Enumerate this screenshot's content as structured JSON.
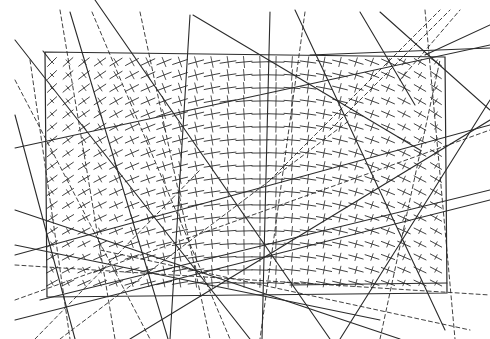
{
  "artwork": {
    "width": 490,
    "height": 339,
    "background": "#ffffff",
    "ink": "#2b2b2b",
    "frame": [
      [
        45,
        52
      ],
      [
        445,
        57
      ],
      [
        447,
        293
      ],
      [
        47,
        297
      ]
    ],
    "hatch_grid": {
      "x0": 52,
      "x1": 440,
      "y0": 62,
      "y1": 288,
      "step_x": 16,
      "step_y": 13,
      "mark_length": 14
    },
    "solid_lines": [
      [
        [
          43,
          51
        ],
        [
          50,
          60
        ]
      ],
      [
        [
          70,
          12
        ],
        [
          168,
          339
        ]
      ],
      [
        [
          15,
          115
        ],
        [
          75,
          339
        ]
      ],
      [
        [
          190,
          15
        ],
        [
          170,
          339
        ]
      ],
      [
        [
          270,
          12
        ],
        [
          262,
          339
        ]
      ],
      [
        [
          193,
          15
        ],
        [
          420,
          150
        ]
      ],
      [
        [
          360,
          12
        ],
        [
          415,
          105
        ]
      ],
      [
        [
          380,
          12
        ],
        [
          490,
          110
        ]
      ],
      [
        [
          15,
          148
        ],
        [
          490,
          45
        ]
      ],
      [
        [
          310,
          55
        ],
        [
          490,
          48
        ]
      ],
      [
        [
          15,
          255
        ],
        [
          490,
          125
        ]
      ],
      [
        [
          15,
          210
        ],
        [
          400,
          339
        ]
      ],
      [
        [
          15,
          40
        ],
        [
          250,
          339
        ]
      ],
      [
        [
          130,
          339
        ],
        [
          490,
          120
        ]
      ],
      [
        [
          15,
          320
        ],
        [
          490,
          200
        ]
      ],
      [
        [
          290,
          285
        ],
        [
          447,
          283
        ]
      ],
      [
        [
          15,
          245
        ],
        [
          380,
          320
        ]
      ],
      [
        [
          295,
          10
        ],
        [
          445,
          330
        ]
      ],
      [
        [
          40,
          300
        ],
        [
          490,
          190
        ]
      ],
      [
        [
          95,
          0
        ],
        [
          330,
          339
        ]
      ],
      [
        [
          425,
          55
        ],
        [
          490,
          25
        ]
      ],
      [
        [
          340,
          339
        ],
        [
          490,
          100
        ]
      ]
    ],
    "dashed_lines": [
      [
        [
          60,
          10
        ],
        [
          115,
          339
        ]
      ],
      [
        [
          92,
          12
        ],
        [
          230,
          339
        ]
      ],
      [
        [
          140,
          12
        ],
        [
          210,
          339
        ]
      ],
      [
        [
          305,
          12
        ],
        [
          260,
          339
        ]
      ],
      [
        [
          270,
          180
        ],
        [
          440,
          10
        ]
      ],
      [
        [
          330,
          130
        ],
        [
          450,
          10
        ]
      ],
      [
        [
          425,
          10
        ],
        [
          455,
          339
        ]
      ],
      [
        [
          15,
          265
        ],
        [
          490,
          295
        ]
      ],
      [
        [
          15,
          80
        ],
        [
          150,
          339
        ]
      ],
      [
        [
          400,
          80
        ],
        [
          460,
          10
        ]
      ],
      [
        [
          15,
          300
        ],
        [
          490,
          130
        ]
      ],
      [
        [
          60,
          339
        ],
        [
          350,
          120
        ]
      ],
      [
        [
          100,
          250
        ],
        [
          470,
          330
        ]
      ],
      [
        [
          380,
          339
        ],
        [
          440,
          60
        ]
      ],
      [
        [
          30,
          60
        ],
        [
          70,
          339
        ]
      ],
      [
        [
          35,
          339
        ],
        [
          200,
          170
        ]
      ]
    ]
  }
}
